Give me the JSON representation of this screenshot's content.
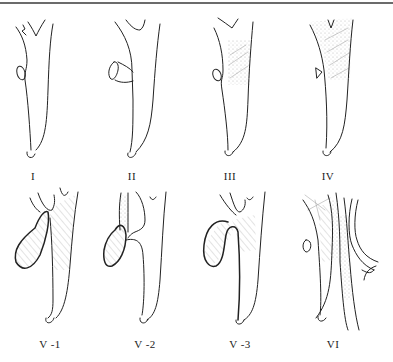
{
  "figure": {
    "panels": [
      {
        "id": "I",
        "label": "I",
        "row": 1
      },
      {
        "id": "II",
        "label": "II",
        "row": 1
      },
      {
        "id": "III",
        "label": "III",
        "row": 1
      },
      {
        "id": "IV",
        "label": "IV",
        "row": 1
      },
      {
        "id": "V-1",
        "label": "V -1",
        "row": 2
      },
      {
        "id": "V-2",
        "label": "V -2",
        "row": 2
      },
      {
        "id": "V-3",
        "label": "V -3",
        "row": 2
      },
      {
        "id": "VI",
        "label": "VI",
        "row": 2
      }
    ]
  },
  "colors": {
    "line": "#222222",
    "top_rule": "#6b6b6b",
    "hatch": "#999999",
    "background": "#ffffff"
  }
}
